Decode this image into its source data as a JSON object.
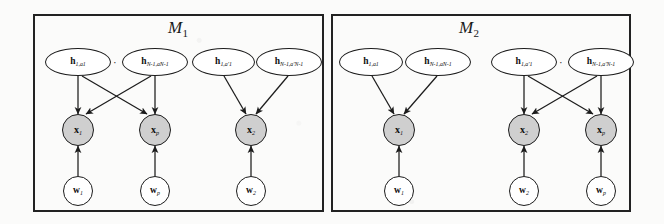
{
  "figure": {
    "caption_absent": true,
    "panels": [
      {
        "id": "m1",
        "title_letter": "M",
        "title_sub": "1",
        "title_full": "M1",
        "groups": [
          {
            "id": "m1-group-a",
            "h_nodes": [
              {
                "id": "m1a-h1",
                "base": "h",
                "sub": "1,a1"
              },
              {
                "id": "m1a-hN",
                "base": "h",
                "sub": "N-1,aN-1"
              }
            ],
            "ellipsis": "· · ·",
            "x_nodes": [
              {
                "id": "m1a-x1",
                "base": "x",
                "sub": "1"
              },
              {
                "id": "m1a-xp",
                "base": "x",
                "sub": "p"
              }
            ],
            "w_nodes": [
              {
                "id": "m1a-w1",
                "base": "w",
                "sub": "1"
              },
              {
                "id": "m1a-wp",
                "base": "w",
                "sub": "p"
              }
            ],
            "connectivity": "full-bipartite"
          },
          {
            "id": "m1-group-b",
            "h_nodes": [
              {
                "id": "m1b-h1",
                "base": "h",
                "sub": "1,a'1"
              },
              {
                "id": "m1b-hN",
                "base": "h",
                "sub": "N-1,a'N-1"
              }
            ],
            "ellipsis": "· · ·",
            "x_nodes": [
              {
                "id": "m1b-x2",
                "base": "x",
                "sub": "2"
              }
            ],
            "w_nodes": [
              {
                "id": "m1b-w2",
                "base": "w",
                "sub": "2"
              }
            ],
            "connectivity": "converging"
          }
        ]
      },
      {
        "id": "m2",
        "title_letter": "M",
        "title_sub": "2",
        "title_full": "M2",
        "groups": [
          {
            "id": "m2-group-a",
            "h_nodes": [
              {
                "id": "m2a-h1",
                "base": "h",
                "sub": "1,a1"
              },
              {
                "id": "m2a-hN",
                "base": "h",
                "sub": "N-1,aN-1"
              }
            ],
            "ellipsis": "· · ·",
            "x_nodes": [
              {
                "id": "m2a-x1",
                "base": "x",
                "sub": "1"
              }
            ],
            "w_nodes": [
              {
                "id": "m2a-w1",
                "base": "w",
                "sub": "1"
              }
            ],
            "connectivity": "converging"
          },
          {
            "id": "m2-group-b",
            "h_nodes": [
              {
                "id": "m2b-h1",
                "base": "h",
                "sub": "1,a'1"
              },
              {
                "id": "m2b-hN",
                "base": "h",
                "sub": "N-1,a'N-1"
              }
            ],
            "ellipsis": "· · ·",
            "x_nodes": [
              {
                "id": "m2b-x2",
                "base": "x",
                "sub": "2"
              },
              {
                "id": "m2b-xp",
                "base": "x",
                "sub": "p"
              }
            ],
            "w_nodes": [
              {
                "id": "m2b-w2",
                "base": "w",
                "sub": "2"
              },
              {
                "id": "m2b-wp",
                "base": "w",
                "sub": "p"
              }
            ],
            "connectivity": "full-bipartite"
          }
        ]
      }
    ],
    "colors": {
      "observed_node_fill": "#cfcfcf",
      "latent_node_fill": "#ffffff",
      "stroke": "#1c1c1c",
      "panel_border": "#222222",
      "background": "#fbfbfa"
    }
  }
}
